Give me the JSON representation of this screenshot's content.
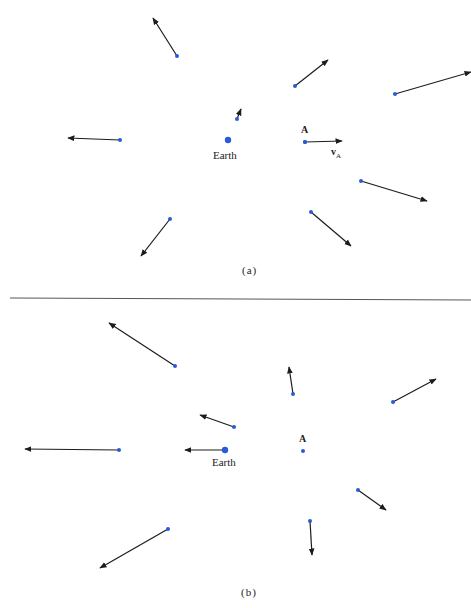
{
  "colors": {
    "dot": "#2a5bd7",
    "arrow": "#1c1c1c",
    "divider": "#555555"
  },
  "panel_a": {
    "caption": "(a)",
    "earth_label": "Earth",
    "a_label": "A",
    "va_label": "v",
    "va_sub": "A",
    "earth": [
      228,
      140
    ],
    "point_a": [
      305,
      142
    ],
    "arrows": [
      {
        "from": [
          177,
          56
        ],
        "to": [
          153,
          18
        ]
      },
      {
        "from": [
          295,
          86
        ],
        "to": [
          328,
          60
        ]
      },
      {
        "from": [
          395,
          94
        ],
        "to": [
          471,
          72
        ]
      },
      {
        "from": [
          237,
          119
        ],
        "to": [
          241,
          109
        ]
      },
      {
        "from": [
          120,
          140
        ],
        "to": [
          68,
          138
        ]
      },
      {
        "from": [
          305,
          142
        ],
        "to": [
          342,
          141
        ]
      },
      {
        "from": [
          361,
          181
        ],
        "to": [
          427,
          201
        ]
      },
      {
        "from": [
          311,
          212
        ],
        "to": [
          351,
          246
        ]
      },
      {
        "from": [
          170,
          219
        ],
        "to": [
          141,
          256
        ]
      }
    ]
  },
  "panel_b": {
    "caption": "(b)",
    "earth_label": "Earth",
    "a_label": "A",
    "earth": [
      225,
      450
    ],
    "point_a": [
      303,
      451
    ],
    "arrows": [
      {
        "from": [
          175,
          366
        ],
        "to": [
          109,
          323
        ]
      },
      {
        "from": [
          293,
          394
        ],
        "to": [
          289,
          367
        ]
      },
      {
        "from": [
          393,
          402
        ],
        "to": [
          436,
          379
        ]
      },
      {
        "from": [
          234,
          427
        ],
        "to": [
          200,
          415
        ]
      },
      {
        "from": [
          119,
          450
        ],
        "to": [
          25,
          449
        ]
      },
      {
        "from": [
          225,
          450
        ],
        "to": [
          185,
          450
        ]
      },
      {
        "from": [
          358,
          490
        ],
        "to": [
          386,
          510
        ]
      },
      {
        "from": [
          310,
          521
        ],
        "to": [
          312,
          555
        ]
      },
      {
        "from": [
          168,
          529
        ],
        "to": [
          100,
          568
        ]
      }
    ]
  }
}
